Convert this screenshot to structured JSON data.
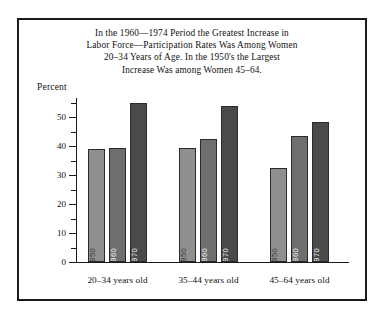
{
  "chart_data": {
    "type": "bar",
    "title_lines": [
      "In the 1960—1974 Period the Greatest Increase in",
      "Labor Force—Participation Rates Was Among Women",
      "20–34 Years of Age. In the 1950's the Largest",
      "Increase Was among Women 45–64."
    ],
    "xlabel": "",
    "ylabel": "Percent",
    "ylim": [
      0,
      57
    ],
    "yticks": [
      0,
      10,
      20,
      30,
      40,
      50
    ],
    "ytick_labels": [
      "0",
      "10",
      "20",
      "30",
      "40",
      "50"
    ],
    "yminor_ticks": [
      5,
      15,
      25,
      35,
      45,
      55
    ],
    "grid": false,
    "legend": "none",
    "categories": [
      "20–34 years old",
      "35–44 years old",
      "45–64 years old"
    ],
    "series": [
      {
        "name": "1950",
        "color": "#8f8f8f",
        "values": [
          39.0,
          39.5,
          32.5
        ]
      },
      {
        "name": "1960",
        "color": "#6e6e6e",
        "values": [
          39.5,
          42.5,
          43.5
        ]
      },
      {
        "name": "1970",
        "color": "#4a4a4a",
        "values": [
          55.0,
          54.0,
          48.5
        ]
      }
    ],
    "bar_inline_labels": [
      "1950",
      "1960",
      "1970"
    ]
  },
  "style": {
    "frame_color": "#1a1a1a",
    "background": "#ffffff",
    "axis_color": "#1a1a1a",
    "text_color": "#111111"
  }
}
